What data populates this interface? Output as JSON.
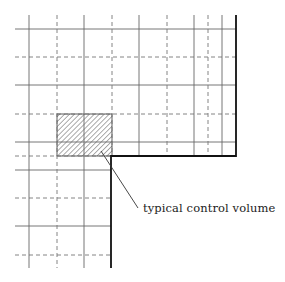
{
  "diagram": {
    "title": "",
    "annotation": {
      "label": "typical control volume",
      "leader_from": [
        101,
        151
      ],
      "leader_to": [
        138,
        208
      ]
    },
    "grid": {
      "solid_vertical_x": [
        29,
        84,
        139,
        194,
        222
      ],
      "dashed_vertical_x": [
        57,
        112,
        167,
        208
      ],
      "solid_horizontal_y": [
        29,
        85,
        142,
        170,
        226
      ],
      "dashed_horizontal_y": [
        57,
        114,
        156,
        198,
        255
      ]
    },
    "control_volume": {
      "x": 57,
      "y": 114,
      "width": 55,
      "height": 42,
      "fill": "hatched"
    },
    "boundary": {
      "points": [
        [
          236,
          15
        ],
        [
          236,
          156
        ],
        [
          111,
          156
        ],
        [
          111,
          268
        ]
      ],
      "color": "#111111"
    },
    "colors": {
      "grid": "#555555",
      "dashed": "#666666",
      "hatch": "#444444"
    }
  }
}
